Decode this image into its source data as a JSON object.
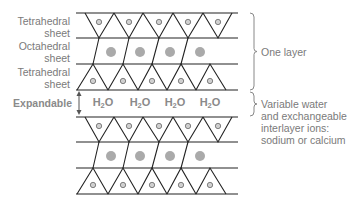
{
  "labels": {
    "tetrahedral_top": [
      "Tetrahedral",
      "sheet"
    ],
    "octahedral": [
      "Octahedral",
      "sheet"
    ],
    "tetrahedral_bottom": [
      "Tetrahedral",
      "sheet"
    ],
    "expandable": "Expandable",
    "one_layer": "One layer",
    "interlayer": [
      "Variable water",
      "and exchangeable",
      "interlayer ions:",
      "sodium or calcium"
    ]
  },
  "water": {
    "prefix": "H",
    "subscript": "2",
    "suffix": "O",
    "count": 4
  },
  "colors": {
    "line": "#222222",
    "brace": "#888888",
    "text": "#7a7a7a",
    "small_ion": "#cfcfcf",
    "large_ion": "#aaaaaa",
    "arrow": "#555555"
  }
}
